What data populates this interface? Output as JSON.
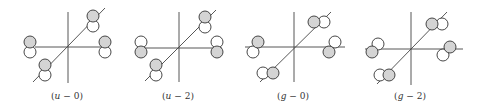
{
  "figure": {
    "panels": [
      {
        "id": "u-0",
        "label": "(u − 0)",
        "label_var": "u",
        "label_rest": " − 0)",
        "center": [
          68,
          47
        ],
        "label_pos": [
          67,
          99
        ],
        "vertical": [
          68,
          12,
          68,
          83
        ],
        "horizontal": [
          35,
          47,
          107,
          47
        ],
        "diagonal": [
          33,
          82,
          105,
          8
        ],
        "lobes": [
          {
            "site": "upper-right",
            "filled": [
              93,
              16
            ],
            "empty": [
              93,
              26
            ]
          },
          {
            "site": "left",
            "filled": [
              30,
              42
            ],
            "empty": [
              30,
              52
            ]
          },
          {
            "site": "right",
            "filled": [
              105,
              42
            ],
            "empty": [
              105,
              52
            ]
          },
          {
            "site": "lower-left",
            "filled": [
              45,
              65
            ],
            "empty": [
              45,
              75
            ]
          }
        ]
      },
      {
        "id": "u-2",
        "label": "(u − 2)",
        "label_var": "u",
        "label_rest": " − 2)",
        "center": [
          179,
          48
        ],
        "label_pos": [
          178,
          99
        ],
        "vertical": [
          179,
          12,
          179,
          82
        ],
        "horizontal": [
          137,
          48,
          222,
          48
        ],
        "diagonal": [
          145,
          81,
          216,
          10
        ],
        "lobes": [
          {
            "site": "upper-right",
            "filled": [
              205,
              17
            ],
            "empty": [
              205,
              27
            ]
          },
          {
            "site": "left",
            "filled": [
              141,
              52
            ],
            "empty": [
              141,
              42
            ]
          },
          {
            "site": "right",
            "filled": [
              217,
              52
            ],
            "empty": [
              217,
              42
            ]
          },
          {
            "site": "lower-left",
            "filled": [
              156,
              65
            ],
            "empty": [
              156,
              75
            ]
          }
        ]
      },
      {
        "id": "g-0",
        "label": "(g − 0)",
        "label_var": "g",
        "label_rest": " − 0)",
        "center": [
          294,
          47
        ],
        "label_pos": [
          293,
          99
        ],
        "vertical": [
          294,
          12,
          294,
          82
        ],
        "horizontal": [
          245,
          47,
          345,
          47
        ],
        "diagonal": [
          260,
          82,
          331,
          12
        ],
        "lobes": [
          {
            "site": "upper-right",
            "filled": [
              314,
              22
            ],
            "empty": [
              324,
              22
            ]
          },
          {
            "site": "left",
            "filled": [
              258,
              42
            ],
            "empty": [
              253,
              52
            ]
          },
          {
            "site": "right",
            "filled": [
              329,
              52
            ],
            "empty": [
              335,
              42
            ]
          },
          {
            "site": "lower-left",
            "filled": [
              273,
              73
            ],
            "empty": [
              263,
              73
            ]
          }
        ]
      },
      {
        "id": "g-2",
        "label": "(g − 2)",
        "label_var": "g",
        "label_rest": " − 2)",
        "center": [
          411,
          49
        ],
        "label_pos": [
          410,
          99
        ],
        "vertical": [
          411,
          12,
          411,
          85
        ],
        "horizontal": [
          365,
          49,
          463,
          49
        ],
        "diagonal": [
          377,
          84,
          447,
          12
        ],
        "lobes": [
          {
            "site": "upper-right",
            "filled": [
              432,
              24
            ],
            "empty": [
              442,
              24
            ]
          },
          {
            "site": "left",
            "filled": [
              372,
              52
            ],
            "empty": [
              378,
              44
            ]
          },
          {
            "site": "right",
            "filled": [
              450,
              47
            ],
            "empty": [
              443,
              55
            ]
          },
          {
            "site": "lower-left",
            "filled": [
              389,
              75
            ],
            "empty": [
              380,
              75
            ]
          }
        ]
      }
    ],
    "lobe_radius": 6,
    "colors": {
      "filled_lobe": "#d4d4d4",
      "empty_lobe": "#ffffff",
      "stroke": "#333333",
      "axis": "#444444"
    }
  }
}
